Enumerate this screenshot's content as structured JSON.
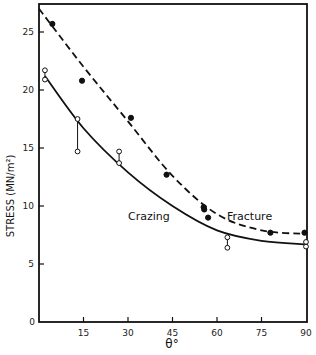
{
  "chart_data": {
    "type": "scatter",
    "title": "",
    "xlabel": "θ°",
    "ylabel": "STRESS (MN/m²)",
    "xlim": [
      0,
      90
    ],
    "ylim": [
      0,
      27
    ],
    "x_ticks": [
      15,
      30,
      45,
      60,
      75,
      90
    ],
    "x_tick_labels": [
      "15",
      "30",
      "45",
      "60",
      "75",
      "90"
    ],
    "y_ticks": [
      0,
      5,
      10,
      15,
      20,
      25
    ],
    "y_tick_labels": [
      "0",
      "5",
      "10",
      "15",
      "20",
      "25"
    ],
    "grid": false,
    "legend": "inline curve labels",
    "series": [
      {
        "name": "Fracture",
        "marker": "filled-circle",
        "line": "dashed",
        "points": [
          {
            "x": 4.5,
            "y": 25.7
          },
          {
            "x": 14.5,
            "y": 20.8
          },
          {
            "x": 31,
            "y": 17.6
          },
          {
            "x": 43,
            "y": 12.7
          },
          {
            "x": 55.5,
            "y": 9.9
          },
          {
            "x": 55.7,
            "y": 9.7
          },
          {
            "x": 57,
            "y": 9.0
          },
          {
            "x": 78,
            "y": 7.7
          },
          {
            "x": 89.5,
            "y": 7.7
          }
        ],
        "fit_curve": [
          {
            "x": 0,
            "y": 27.0
          },
          {
            "x": 15,
            "y": 22.0
          },
          {
            "x": 30,
            "y": 17.3
          },
          {
            "x": 45,
            "y": 12.6
          },
          {
            "x": 60,
            "y": 9.3
          },
          {
            "x": 75,
            "y": 7.9
          },
          {
            "x": 90,
            "y": 7.6
          }
        ]
      },
      {
        "name": "Crazing",
        "marker": "open-circle",
        "line": "solid",
        "points": [
          {
            "x": 2,
            "y": 21.7
          },
          {
            "x": 2,
            "y": 20.9
          },
          {
            "x": 13,
            "y": 17.5
          },
          {
            "x": 13,
            "y": 14.7
          },
          {
            "x": 27,
            "y": 14.7
          },
          {
            "x": 27,
            "y": 13.7
          },
          {
            "x": 63.5,
            "y": 7.3
          },
          {
            "x": 63.5,
            "y": 6.4
          },
          {
            "x": 90,
            "y": 6.9
          },
          {
            "x": 90,
            "y": 6.5
          }
        ],
        "range_bars": [
          {
            "x": 2,
            "y1": 20.9,
            "y2": 21.7
          },
          {
            "x": 13,
            "y1": 14.7,
            "y2": 17.5
          },
          {
            "x": 27,
            "y1": 13.7,
            "y2": 14.7
          },
          {
            "x": 63.5,
            "y1": 6.4,
            "y2": 7.3
          },
          {
            "x": 90,
            "y1": 6.5,
            "y2": 6.9
          }
        ],
        "fit_curve": [
          {
            "x": 2,
            "y": 21.2
          },
          {
            "x": 15,
            "y": 16.7
          },
          {
            "x": 30,
            "y": 12.9
          },
          {
            "x": 45,
            "y": 10.0
          },
          {
            "x": 60,
            "y": 7.9
          },
          {
            "x": 75,
            "y": 7.0
          },
          {
            "x": 90,
            "y": 6.7
          }
        ]
      }
    ],
    "annotations": [
      {
        "text": "Crazing",
        "x": 37,
        "y": 8.8
      },
      {
        "text": "Fracture",
        "x": 64,
        "y": 8.8
      }
    ]
  },
  "labels": {
    "xlabel": "θ°",
    "ylabel": "STRESS (MN/m²)",
    "crazing": "Crazing",
    "fracture": "Fracture"
  }
}
